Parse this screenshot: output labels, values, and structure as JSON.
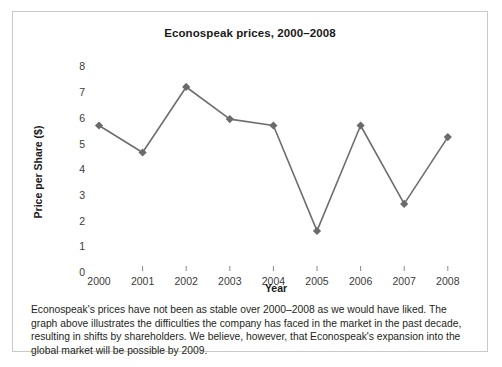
{
  "figure": {
    "caption": "Econospeak's prices have not been as stable over 2000–2008 as we would have liked. The graph above illustrates the difficulties the company has faced in the market in the past decade, resulting in shifts by shareholders. We believe, however, that Econospeak's expansion into the global market will be possible by 2009."
  },
  "colors": {
    "line": "#6e6e6e",
    "marker": "#6b6b6b",
    "tick_mark": "#8a8a8a",
    "text": "#231f20",
    "border": "#c9c9c9",
    "background": "#ffffff"
  },
  "chart_data": {
    "type": "line",
    "title": "Econospeak prices, 2000–2008",
    "xlabel": "Year",
    "ylabel": "Price per Share ($)",
    "categories": [
      "2000",
      "2001",
      "2002",
      "2003",
      "2004",
      "2005",
      "2006",
      "2007",
      "2008"
    ],
    "values": [
      5.7,
      4.65,
      7.2,
      5.95,
      5.7,
      1.6,
      5.7,
      2.65,
      5.25
    ],
    "ylim": [
      0,
      8
    ],
    "yticks": [
      "0",
      "1",
      "2",
      "3",
      "4",
      "5",
      "6",
      "7",
      "8"
    ],
    "ytick_values": [
      0,
      1,
      2,
      3,
      4,
      5,
      6,
      7,
      8
    ],
    "grid": false,
    "legend": false,
    "marker": "diamond"
  }
}
